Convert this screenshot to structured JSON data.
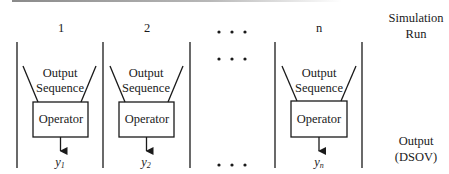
{
  "diagram": {
    "type": "parallel simulation runs feeding operators",
    "columns": [
      {
        "label": "1",
        "funnel_label_line1": "Output",
        "funnel_label_line2": "Sequence",
        "operator_label": "Operator",
        "output_symbol": "y",
        "output_subscript": "1"
      },
      {
        "label": "2",
        "funnel_label_line1": "Output",
        "funnel_label_line2": "Sequence",
        "operator_label": "Operator",
        "output_symbol": "y",
        "output_subscript": "2"
      },
      {
        "label": "n",
        "funnel_label_line1": "Output",
        "funnel_label_line2": "Sequence",
        "operator_label": "Operator",
        "output_symbol": "y",
        "output_subscript": "n"
      }
    ],
    "ellipsis": "• • •",
    "side_labels": {
      "top_line1": "Simulation",
      "top_line2": "Run",
      "bottom_line1": "Output",
      "bottom_line2": "(DSOV)"
    },
    "colors": {
      "line": "#1a1a1a",
      "background": "#ffffff",
      "top_rule": "#8a8a8a"
    }
  }
}
